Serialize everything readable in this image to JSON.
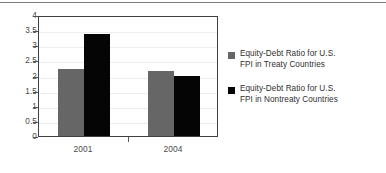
{
  "figure": {
    "background_color": "#ffffff",
    "rule_color": "#7a7a7a",
    "frame_color": "#404040"
  },
  "chart_data": {
    "type": "bar",
    "title": "",
    "subtitle": "",
    "xlabel": "",
    "ylabel": "",
    "categories": [
      "2001",
      "2004"
    ],
    "series": [
      {
        "name": "Equity-Debt Ratio for U.S.\nFPI in Treaty Countries",
        "color": "#666666",
        "values": [
          2.2,
          2.15
        ]
      },
      {
        "name": "Equity-Debt Ratio for U.S.\nFPI in Nontreaty Countries",
        "color": "#050505",
        "values": [
          3.37,
          2.0
        ]
      }
    ],
    "ylim": [
      0,
      4
    ],
    "ytick_values": [
      0,
      0.5,
      1,
      1.5,
      2,
      2.5,
      3,
      3.5,
      4
    ],
    "ytick_labels": [
      "0",
      "0.5",
      "1",
      "1.5",
      "2",
      "2.5",
      "3",
      "3.5",
      "4"
    ],
    "xtick_labels": [
      "2001",
      "2004"
    ],
    "grid": true,
    "grid_axis": "y",
    "legend_position": "right",
    "legend": [
      {
        "label_line1": "Equity-Debt Ratio for U.S.",
        "label_line2": "FPI in Treaty Countries",
        "swatch_color": "#666666"
      },
      {
        "label_line1": "Equity-Debt Ratio for U.S.",
        "label_line2": "FPI in Nontreaty Countries",
        "swatch_color": "#050505"
      }
    ]
  }
}
